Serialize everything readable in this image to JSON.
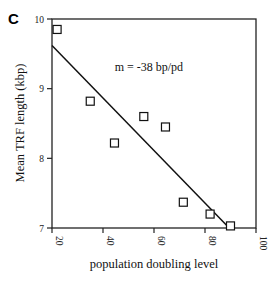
{
  "panel_label": "C",
  "chart_data": {
    "type": "scatter",
    "title": "",
    "xlabel": "population doubling level",
    "ylabel": "Mean TRF length (kbp)",
    "xlim": [
      20,
      100
    ],
    "ylim": [
      7,
      10
    ],
    "xticks": [
      20,
      40,
      60,
      80,
      100
    ],
    "yticks": [
      7,
      8,
      9,
      10
    ],
    "grid": false,
    "legend": null,
    "series": [
      {
        "name": "Mean TRF length",
        "marker": "open-square",
        "x": [
          22,
          35,
          44.5,
          56,
          64.5,
          71.5,
          82,
          90
        ],
        "y": [
          9.85,
          8.82,
          8.22,
          8.6,
          8.45,
          7.37,
          7.2,
          7.03
        ]
      }
    ],
    "fit_line": {
      "x": [
        20,
        89.5
      ],
      "y": [
        9.62,
        7.0
      ]
    },
    "annotations": [
      {
        "text": "m = -38 bp/pd",
        "x": 58,
        "y": 9.25
      }
    ]
  }
}
